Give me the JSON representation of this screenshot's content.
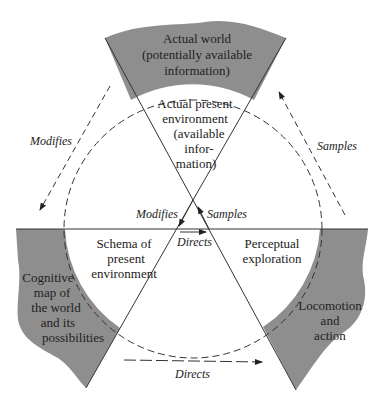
{
  "colors": {
    "region_fill": "#8e8e8e",
    "line": "#333333",
    "text": "#222222",
    "background": "#ffffff"
  },
  "regions": {
    "top": {
      "lines": [
        "Actual world",
        "(potentially available",
        "information)"
      ]
    },
    "bottom_left": {
      "lines": [
        "Cognitive",
        "map of",
        "the world",
        "and its",
        "possibilities"
      ]
    },
    "bottom_right": {
      "lines": [
        "Locomotion",
        "and",
        "action"
      ]
    }
  },
  "inner": {
    "top": {
      "lines": [
        "Actual present",
        "environment",
        "(available",
        "infor-",
        "mation)"
      ]
    },
    "left": {
      "lines": [
        "Schema of",
        "present",
        "environment"
      ]
    },
    "right": {
      "lines": [
        "Perceptual",
        "exploration"
      ]
    }
  },
  "arrows": {
    "outer_left": "Modifies",
    "outer_right": "Samples",
    "outer_bottom": "Directs",
    "inner_left": "Modifies",
    "inner_right": "Samples",
    "inner_center": "Directs"
  }
}
